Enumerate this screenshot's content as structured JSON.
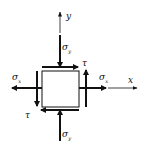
{
  "diagram": {
    "type": "plane-stress-element",
    "colors": {
      "stroke": "#111111",
      "background": "#ffffff"
    },
    "axes": {
      "x": {
        "label": "x"
      },
      "y": {
        "label": "y"
      }
    },
    "element": {
      "shape": "square"
    },
    "stresses": {
      "sigma_y_top": {
        "symbol": "σ",
        "subscript": "y",
        "direction": "down"
      },
      "sigma_y_bottom": {
        "symbol": "σ",
        "subscript": "y",
        "direction": "up"
      },
      "sigma_x_left": {
        "symbol": "σ",
        "subscript": "x",
        "direction": "left"
      },
      "sigma_x_right": {
        "symbol": "σ",
        "subscript": "x",
        "direction": "right"
      },
      "tau_top": {
        "symbol": "τ",
        "direction": "right"
      },
      "tau_right": {
        "symbol": "τ",
        "direction": "up"
      },
      "tau_left": {
        "symbol": "τ",
        "direction": "down"
      },
      "tau_bottom": {
        "symbol": "τ",
        "direction": "left"
      }
    }
  }
}
